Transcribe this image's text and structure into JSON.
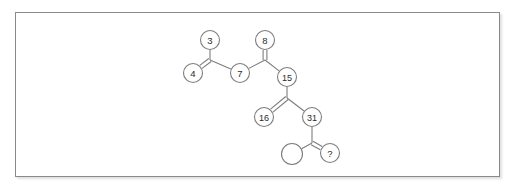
{
  "figure": {
    "type": "molecular-structure-diagram",
    "frame": {
      "x": 15,
      "y": 12,
      "width": 485,
      "height": 165,
      "border_color": "#8a8a8a",
      "background": "#ffffff"
    },
    "style": {
      "bond_color": "#7d7d7d",
      "node_stroke": "#7d7d7d",
      "node_fill": "#ffffff",
      "label_color": "#2b2b2b"
    },
    "nodes": [
      {
        "id": "node-3",
        "label": "3",
        "cx": 210,
        "cy": 40,
        "r": 9.5,
        "kind": "numbered"
      },
      {
        "id": "node-8",
        "label": "8",
        "cx": 265,
        "cy": 40,
        "r": 9.5,
        "kind": "numbered"
      },
      {
        "id": "node-4",
        "label": "4",
        "cx": 193,
        "cy": 73,
        "r": 9.5,
        "kind": "numbered"
      },
      {
        "id": "node-7",
        "label": "7",
        "cx": 240,
        "cy": 73,
        "r": 9.5,
        "kind": "numbered"
      },
      {
        "id": "node-15",
        "label": "15",
        "cx": 287,
        "cy": 77,
        "r": 9.5,
        "kind": "numbered"
      },
      {
        "id": "node-16",
        "label": "16",
        "cx": 264,
        "cy": 117,
        "r": 9.5,
        "kind": "numbered"
      },
      {
        "id": "node-31",
        "label": "31",
        "cx": 312,
        "cy": 117,
        "r": 9.5,
        "kind": "numbered"
      },
      {
        "id": "node-empty",
        "label": "",
        "cx": 292,
        "cy": 154,
        "r": 10.5,
        "kind": "empty"
      },
      {
        "id": "node-unknown",
        "label": "?",
        "cx": 330,
        "cy": 153,
        "r": 9.5,
        "kind": "unknown"
      }
    ],
    "vertices": [
      {
        "id": "vertex-a",
        "x": 210,
        "y": 60
      },
      {
        "id": "vertex-b",
        "x": 265,
        "y": 60
      },
      {
        "id": "vertex-c",
        "x": 287,
        "y": 98
      },
      {
        "id": "vertex-d",
        "x": 312,
        "y": 143
      }
    ],
    "bonds": [
      {
        "id": "bond-3-a",
        "from": "node-3",
        "to": "vertex-a",
        "order": 1
      },
      {
        "id": "bond-a-4",
        "from": "vertex-a",
        "to": "node-4",
        "order": 2
      },
      {
        "id": "bond-a-7",
        "from": "vertex-a",
        "to": "node-7",
        "order": 1
      },
      {
        "id": "bond-7-b",
        "from": "node-7",
        "to": "vertex-b",
        "order": 1
      },
      {
        "id": "bond-b-8",
        "from": "vertex-b",
        "to": "node-8",
        "order": 2
      },
      {
        "id": "bond-b-15",
        "from": "vertex-b",
        "to": "node-15",
        "order": 1
      },
      {
        "id": "bond-15-c",
        "from": "node-15",
        "to": "vertex-c",
        "order": 1
      },
      {
        "id": "bond-c-16",
        "from": "vertex-c",
        "to": "node-16",
        "order": 2
      },
      {
        "id": "bond-c-31",
        "from": "vertex-c",
        "to": "node-31",
        "order": 1
      },
      {
        "id": "bond-31-d",
        "from": "node-31",
        "to": "vertex-d",
        "order": 1
      },
      {
        "id": "bond-d-empty",
        "from": "vertex-d",
        "to": "node-empty",
        "order": 1
      },
      {
        "id": "bond-d-unknown",
        "from": "vertex-d",
        "to": "node-unknown",
        "order": 2
      }
    ],
    "labels": {
      "node_3": "3",
      "node_8": "8",
      "node_4": "4",
      "node_7": "7",
      "node_15": "15",
      "node_16": "16",
      "node_31": "31",
      "node_unknown": "?",
      "node_empty": ""
    }
  }
}
